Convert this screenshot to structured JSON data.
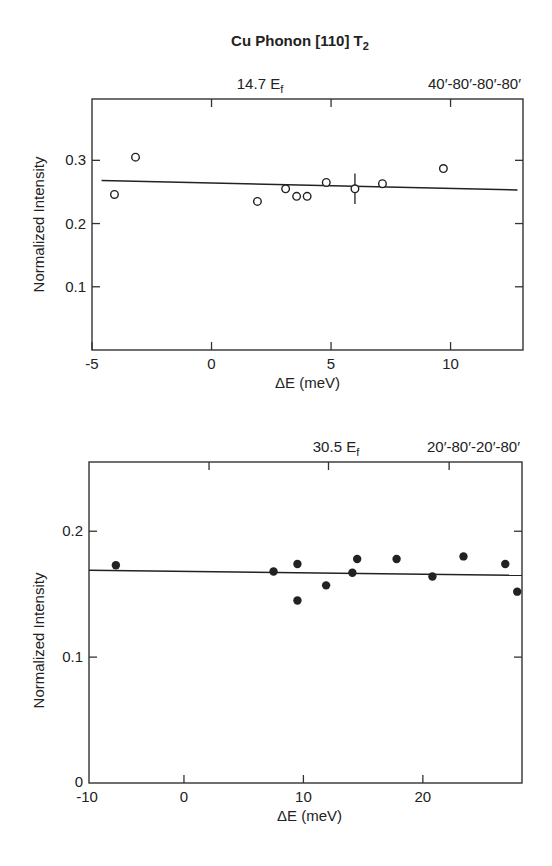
{
  "figure": {
    "title": "Cu Phonon [110] T",
    "title_subscript": "2"
  },
  "chart_data": [
    {
      "type": "scatter",
      "panel": "top",
      "annotation_left": "14.7 E",
      "annotation_left_sub": "f",
      "annotation_right": "40′-80′-80′-80′",
      "xlabel": "ΔE (meV)",
      "ylabel": "Normalized Intensity",
      "xlim": [
        -5,
        13.03
      ],
      "ylim": [
        0,
        0.397
      ],
      "xticks": [
        -5,
        0,
        5,
        10
      ],
      "xtick_labels": [
        "-5",
        "0",
        "5",
        "10"
      ],
      "top_ticks": [
        0,
        5,
        10
      ],
      "yticks": [
        0.1,
        0.2,
        0.3
      ],
      "ytick_labels": [
        "0.1",
        "0.2",
        "0.3"
      ],
      "right_ticks": [
        0.1,
        0.2,
        0.3
      ],
      "grid": false,
      "marker": "open-circle",
      "series": [
        {
          "name": "14.7 meV Ef, collimation 40'-80'-80'-80'",
          "x": [
            -4.06,
            -3.18,
            1.92,
            3.1,
            3.56,
            4.0,
            4.8,
            6.0,
            7.15,
            9.7
          ],
          "y": [
            0.246,
            0.305,
            0.235,
            0.255,
            0.243,
            0.243,
            0.265,
            0.255,
            0.263,
            0.287
          ],
          "yerr": [
            null,
            null,
            null,
            null,
            null,
            null,
            null,
            0.024,
            null,
            null
          ]
        }
      ],
      "fit_line": {
        "x": [
          -4.6,
          12.8
        ],
        "y": [
          0.268,
          0.253
        ]
      },
      "box": {
        "left": 92,
        "top": 99,
        "right": 523,
        "bottom": 350
      }
    },
    {
      "type": "scatter",
      "panel": "bottom",
      "annotation_left": "30.5 E",
      "annotation_left_sub": "f",
      "annotation_right": "20′-80′-20′-80′",
      "xlabel": "ΔE (meV)",
      "ylabel": "Normalized Intensity",
      "xlim": [
        -7.95,
        28.3
      ],
      "ylim": [
        0,
        0.255
      ],
      "xticks": [
        0,
        10,
        20
      ],
      "xtick_labels": [
        "0",
        "10",
        "20"
      ],
      "corner_xlabel": "-10",
      "corner_ylabel": "0",
      "top_ticks": [
        2.1,
        12.1,
        22.2
      ],
      "yticks": [
        0.1,
        0.2
      ],
      "ytick_labels": [
        "0.1",
        "0.2"
      ],
      "right_ticks": [
        0.1,
        0.2
      ],
      "grid": false,
      "marker": "filled-circle",
      "series": [
        {
          "name": "30.5 meV Ef, collimation 20'-80'-20'-80'",
          "x": [
            -5.7,
            7.5,
            9.5,
            9.5,
            11.9,
            14.1,
            14.5,
            17.8,
            20.8,
            23.4,
            26.9,
            27.9
          ],
          "y": [
            0.173,
            0.168,
            0.174,
            0.145,
            0.157,
            0.167,
            0.178,
            0.178,
            0.164,
            0.18,
            0.174,
            0.152
          ]
        }
      ],
      "fit_line": {
        "x": [
          -7.95,
          28.3
        ],
        "y": [
          0.169,
          0.165
        ]
      },
      "box": {
        "left": 89,
        "top": 462,
        "right": 522,
        "bottom": 783
      }
    }
  ]
}
